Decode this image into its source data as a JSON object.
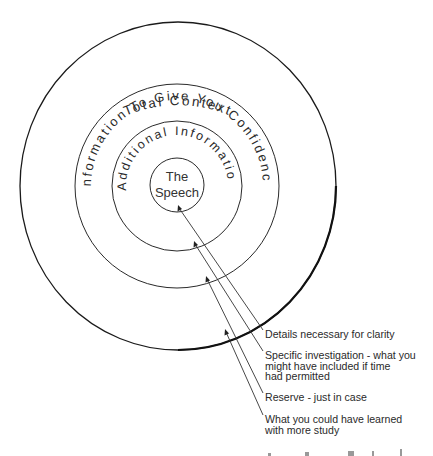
{
  "diagram": {
    "type": "concentric-circles",
    "rings": [
      {
        "id": "speech",
        "label_lines": [
          "The",
          "Speech"
        ]
      },
      {
        "id": "additional",
        "label": "Additional Information"
      },
      {
        "id": "confidence",
        "label": "Information To Give You Confidence"
      },
      {
        "id": "total",
        "label": "Total Context"
      }
    ],
    "annotations": [
      {
        "target": "speech",
        "lines": [
          "Details necessary for clarity"
        ]
      },
      {
        "target": "additional",
        "lines": [
          "Specific investigation - what you",
          "might have included if time",
          "had permitted"
        ]
      },
      {
        "target": "confidence",
        "lines": [
          "Reserve - just in case"
        ]
      },
      {
        "target": "total",
        "lines": [
          "What you could have learned",
          "with more study"
        ]
      }
    ],
    "colors": {
      "ink": "#2a2a2a",
      "background": "#ffffff"
    }
  }
}
